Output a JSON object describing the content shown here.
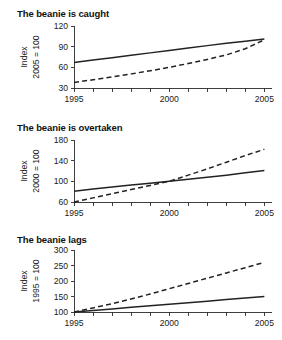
{
  "figure": {
    "background": "#ffffff",
    "line_color": "#222222",
    "axis_color": "#2b2b2b"
  },
  "chart_data": [
    {
      "type": "line",
      "title": "The beanie is caught",
      "xlabel": "",
      "ylabel": "Index",
      "ylabel_line2": "2005 = 100",
      "grid": false,
      "legend": "none",
      "xlim": [
        1995,
        2005.4
      ],
      "ylim": [
        30,
        120
      ],
      "yticks": [
        30,
        60,
        90,
        120
      ],
      "ytick_labels": [
        "30",
        "60",
        "90",
        "120"
      ],
      "xticks": [
        1995,
        1996,
        1997,
        1998,
        1999,
        2000,
        2001,
        2002,
        2003,
        2004,
        2005
      ],
      "xtick_labels": [
        "1995",
        "",
        "",
        "",
        "",
        "2000",
        "",
        "",
        "",
        "",
        "2005"
      ],
      "x": [
        1995,
        1996,
        1997,
        1998,
        1999,
        2000,
        2001,
        2002,
        2003,
        2004,
        2005
      ],
      "series": [
        {
          "name": "solid",
          "style": "solid",
          "values": [
            67,
            70.5,
            74,
            77.5,
            81,
            84.5,
            88,
            91.5,
            95,
            98,
            101
          ]
        },
        {
          "name": "dashed",
          "style": "dashed",
          "values": [
            38,
            42,
            46,
            50.5,
            55,
            60,
            65.5,
            71.5,
            78,
            87,
            100
          ]
        }
      ]
    },
    {
      "type": "line",
      "title": "The beanie is overtaken",
      "xlabel": "",
      "ylabel": "Index",
      "ylabel_line2": "2000 = 100",
      "grid": false,
      "legend": "none",
      "xlim": [
        1995,
        2005.4
      ],
      "ylim": [
        60,
        180
      ],
      "yticks": [
        60,
        100,
        140,
        180
      ],
      "ytick_labels": [
        "60",
        "100",
        "140",
        "180"
      ],
      "xticks": [
        1995,
        1996,
        1997,
        1998,
        1999,
        2000,
        2001,
        2002,
        2003,
        2004,
        2005
      ],
      "xtick_labels": [
        "1995",
        "",
        "",
        "",
        "",
        "2000",
        "",
        "",
        "",
        "",
        "2005"
      ],
      "x": [
        1995,
        1996,
        1997,
        1998,
        1999,
        2000,
        2001,
        2002,
        2003,
        2004,
        2005
      ],
      "series": [
        {
          "name": "solid",
          "style": "solid",
          "values": [
            81,
            85,
            89,
            93,
            96.5,
            100,
            104,
            108,
            112,
            116.5,
            121
          ]
        },
        {
          "name": "dashed",
          "style": "dashed",
          "values": [
            60,
            68,
            76,
            84,
            92,
            100,
            112,
            124,
            137,
            150,
            162
          ]
        }
      ]
    },
    {
      "type": "line",
      "title": "The beanie lags",
      "xlabel": "",
      "ylabel": "Index",
      "ylabel_line2": "1995 = 100",
      "grid": false,
      "legend": "none",
      "xlim": [
        1995,
        2005.4
      ],
      "ylim": [
        100,
        300
      ],
      "yticks": [
        100,
        150,
        200,
        250,
        300
      ],
      "ytick_labels": [
        "100",
        "150",
        "200",
        "250",
        "300"
      ],
      "xticks": [
        1995,
        1996,
        1997,
        1998,
        1999,
        2000,
        2001,
        2002,
        2003,
        2004,
        2005
      ],
      "xtick_labels": [
        "1995",
        "",
        "",
        "",
        "",
        "2000",
        "",
        "",
        "",
        "",
        "2005"
      ],
      "x": [
        1995,
        1996,
        1997,
        1998,
        1999,
        2000,
        2001,
        2002,
        2003,
        2004,
        2005
      ],
      "series": [
        {
          "name": "solid",
          "style": "solid",
          "values": [
            100,
            105,
            110,
            115,
            120,
            125,
            130,
            135,
            140,
            145,
            150
          ]
        },
        {
          "name": "dashed",
          "style": "dashed",
          "values": [
            100,
            113,
            127,
            142,
            158,
            175,
            192,
            209,
            226,
            243,
            260
          ]
        }
      ]
    }
  ]
}
